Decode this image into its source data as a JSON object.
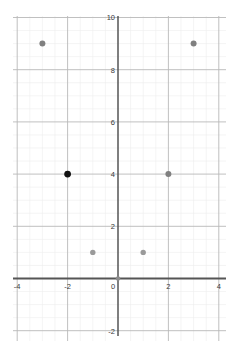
{
  "chart_data": {
    "type": "scatter",
    "title": "",
    "subtitle": "",
    "xlabel": "",
    "ylabel": "",
    "xlim": [
      -4.3,
      4.3
    ],
    "ylim": [
      -2.6,
      10.6
    ],
    "grid": true,
    "grid_major_step": 2,
    "grid_minor_step": 0.5,
    "legend": "none",
    "axis_line_color": "#555555",
    "grid_major_color": "#b9b9b9",
    "grid_minor_color": "#ececec",
    "point_color": "#808080",
    "highlight_point_color": "#111111",
    "xticks": [
      -4,
      -2,
      0,
      2,
      4
    ],
    "xtick_labels": [
      "-4",
      "-2",
      "0",
      "2",
      "4"
    ],
    "yticks": [
      -2,
      0,
      2,
      4,
      6,
      8,
      10
    ],
    "ytick_labels": [
      "-2",
      "0",
      "2",
      "4",
      "6",
      "8",
      "10"
    ],
    "points": [
      {
        "x": -3,
        "y": 9,
        "color": "#808080",
        "radius": 3.0,
        "highlight": false
      },
      {
        "x": 3,
        "y": 9,
        "color": "#808080",
        "radius": 3.0,
        "highlight": false
      },
      {
        "x": -2,
        "y": 4,
        "color": "#111111",
        "radius": 3.4,
        "highlight": true
      },
      {
        "x": 2,
        "y": 4,
        "color": "#808080",
        "radius": 3.0,
        "highlight": false
      },
      {
        "x": -1,
        "y": 1,
        "color": "#9a9a9a",
        "radius": 2.7,
        "highlight": false
      },
      {
        "x": 1,
        "y": 1,
        "color": "#9a9a9a",
        "radius": 2.7,
        "highlight": false
      },
      {
        "x": 0,
        "y": 0,
        "color": "#8c8c8c",
        "radius": 2.2,
        "highlight": false
      }
    ]
  }
}
